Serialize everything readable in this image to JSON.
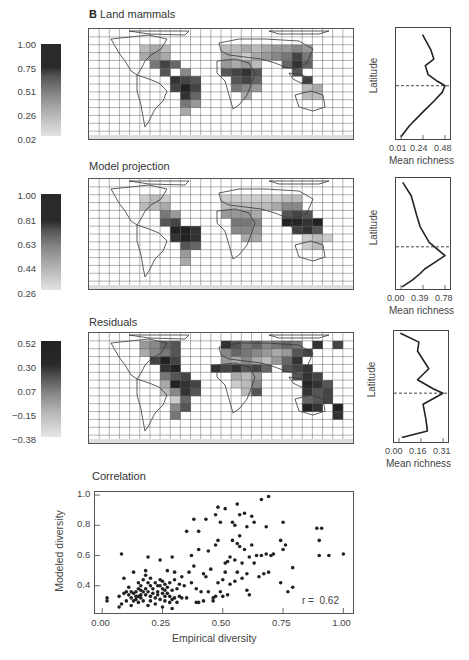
{
  "panel_label": "B",
  "panels": [
    {
      "title": "Land mammals",
      "colorbar": {
        "ticks": [
          "1.00",
          "0.75",
          "0.51",
          "0.26",
          "0.02"
        ]
      },
      "profile": {
        "xticks": [
          "0.01",
          "0.24",
          "0.48"
        ],
        "xlabel": "Mean richness",
        "ylabel": "Latitude"
      }
    },
    {
      "title": "Model projection",
      "colorbar": {
        "ticks": [
          "1.00",
          "0.81",
          "0.63",
          "0.44",
          "0.26"
        ]
      },
      "profile": {
        "xticks": [
          "0.00",
          "0.39",
          "0.78"
        ],
        "xlabel": "Mean richness",
        "ylabel": "Latitude"
      }
    },
    {
      "title": "Residuals",
      "colorbar": {
        "ticks": [
          "0.52",
          "0.30",
          "0.07",
          "−0.15",
          "−0.38"
        ]
      },
      "profile": {
        "xticks": [
          "0.00",
          "0.16",
          "0.31"
        ],
        "xlabel": "Mean richness",
        "ylabel": "Latitude"
      }
    }
  ],
  "correlation": {
    "title": "Correlation",
    "annotation": "r =  0.62"
  },
  "chart_data": [
    {
      "type": "heatmap",
      "title": "B Land mammals",
      "description": "Gridded world map of empirical land mammal diversity (greyscale, darker = higher)",
      "colorbar": {
        "min": 0.02,
        "max": 1.0,
        "ticks": [
          1.0,
          0.75,
          0.51,
          0.26,
          0.02
        ]
      }
    },
    {
      "type": "line",
      "title": "Land mammals latitudinal profile",
      "xlabel": "Mean richness",
      "ylabel": "Latitude",
      "xticks": [
        0.01,
        0.24,
        0.48
      ],
      "x": [
        0.24,
        0.33,
        0.36,
        0.27,
        0.3,
        0.4,
        0.48,
        0.45,
        0.36,
        0.24,
        0.1,
        0.01
      ],
      "y_frac": [
        0.06,
        0.2,
        0.28,
        0.34,
        0.42,
        0.48,
        0.52,
        0.58,
        0.66,
        0.76,
        0.88,
        0.98
      ],
      "equator_line": 0.52
    },
    {
      "type": "heatmap",
      "title": "Model projection",
      "description": "Gridded world map of modelled land mammal diversity",
      "colorbar": {
        "min": 0.26,
        "max": 1.0,
        "ticks": [
          1.0,
          0.81,
          0.63,
          0.44,
          0.26
        ]
      }
    },
    {
      "type": "line",
      "title": "Model projection latitudinal profile",
      "xlabel": "Mean richness",
      "ylabel": "Latitude",
      "xticks": [
        0.0,
        0.39,
        0.78
      ],
      "x": [
        0.03,
        0.18,
        0.28,
        0.34,
        0.5,
        0.78,
        0.6,
        0.42,
        0.34,
        0.2,
        0.02
      ],
      "y_frac": [
        0.04,
        0.16,
        0.34,
        0.44,
        0.58,
        0.7,
        0.76,
        0.82,
        0.86,
        0.92,
        0.98
      ],
      "equator_line": 0.62
    },
    {
      "type": "heatmap",
      "title": "Residuals",
      "description": "Gridded world map of residuals (empirical minus modelled)",
      "colorbar": {
        "min": -0.38,
        "max": 0.52,
        "ticks": [
          0.52,
          0.3,
          0.07,
          -0.15,
          -0.38
        ]
      }
    },
    {
      "type": "line",
      "title": "Residuals latitudinal profile",
      "xlabel": "Mean richness",
      "ylabel": "Latitude",
      "xticks": [
        0.0,
        0.16,
        0.31
      ],
      "x": [
        0.01,
        0.14,
        0.13,
        0.21,
        0.13,
        0.24,
        0.31,
        0.17,
        0.19,
        0.2,
        0.02
      ],
      "y_frac": [
        0.02,
        0.1,
        0.18,
        0.34,
        0.44,
        0.52,
        0.56,
        0.66,
        0.8,
        0.9,
        0.96
      ],
      "equator_line": 0.56
    },
    {
      "type": "scatter",
      "title": "Correlation",
      "xlabel": "Empirical diversity",
      "ylabel": "Modeled diversity",
      "xlim": [
        -0.03,
        1.04
      ],
      "ylim": [
        0.22,
        1.02
      ],
      "xticks": [
        0.0,
        0.25,
        0.5,
        0.75,
        1.0
      ],
      "yticks": [
        0.4,
        0.6,
        0.8,
        1.0
      ],
      "annotation": "r = 0.62",
      "points": [
        [
          0.02,
          0.32
        ],
        [
          0.02,
          0.3
        ],
        [
          0.07,
          0.33
        ],
        [
          0.07,
          0.26
        ],
        [
          0.08,
          0.28
        ],
        [
          0.08,
          0.61
        ],
        [
          0.09,
          0.45
        ],
        [
          0.09,
          0.35
        ],
        [
          0.1,
          0.36
        ],
        [
          0.1,
          0.3
        ],
        [
          0.11,
          0.39
        ],
        [
          0.11,
          0.34
        ],
        [
          0.12,
          0.36
        ],
        [
          0.12,
          0.32
        ],
        [
          0.12,
          0.27
        ],
        [
          0.13,
          0.35
        ],
        [
          0.13,
          0.3
        ],
        [
          0.13,
          0.49
        ],
        [
          0.14,
          0.36
        ],
        [
          0.14,
          0.33
        ],
        [
          0.14,
          0.31
        ],
        [
          0.15,
          0.38
        ],
        [
          0.15,
          0.42
        ],
        [
          0.15,
          0.33
        ],
        [
          0.15,
          0.29
        ],
        [
          0.16,
          0.34
        ],
        [
          0.16,
          0.37
        ],
        [
          0.16,
          0.4
        ],
        [
          0.16,
          0.32
        ],
        [
          0.17,
          0.44
        ],
        [
          0.17,
          0.36
        ],
        [
          0.17,
          0.3
        ],
        [
          0.18,
          0.47
        ],
        [
          0.18,
          0.5
        ],
        [
          0.18,
          0.38
        ],
        [
          0.18,
          0.34
        ],
        [
          0.19,
          0.59
        ],
        [
          0.19,
          0.42
        ],
        [
          0.19,
          0.36
        ],
        [
          0.19,
          0.27
        ],
        [
          0.2,
          0.45
        ],
        [
          0.2,
          0.4
        ],
        [
          0.2,
          0.33
        ],
        [
          0.2,
          0.3
        ],
        [
          0.21,
          0.38
        ],
        [
          0.21,
          0.35
        ],
        [
          0.22,
          0.42
        ],
        [
          0.22,
          0.32
        ],
        [
          0.22,
          0.28
        ],
        [
          0.23,
          0.4
        ],
        [
          0.23,
          0.36
        ],
        [
          0.23,
          0.34
        ],
        [
          0.24,
          0.44
        ],
        [
          0.24,
          0.4
        ],
        [
          0.24,
          0.31
        ],
        [
          0.24,
          0.57
        ],
        [
          0.25,
          0.43
        ],
        [
          0.25,
          0.38
        ],
        [
          0.25,
          0.35
        ],
        [
          0.25,
          0.26
        ],
        [
          0.26,
          0.41
        ],
        [
          0.26,
          0.37
        ],
        [
          0.26,
          0.33
        ],
        [
          0.26,
          0.3
        ],
        [
          0.27,
          0.5
        ],
        [
          0.27,
          0.39
        ],
        [
          0.27,
          0.35
        ],
        [
          0.28,
          0.42
        ],
        [
          0.28,
          0.33
        ],
        [
          0.28,
          0.29
        ],
        [
          0.29,
          0.59
        ],
        [
          0.29,
          0.37
        ],
        [
          0.29,
          0.31
        ],
        [
          0.29,
          0.25
        ],
        [
          0.3,
          0.44
        ],
        [
          0.3,
          0.32
        ],
        [
          0.3,
          0.49
        ],
        [
          0.31,
          0.38
        ],
        [
          0.31,
          0.29
        ],
        [
          0.32,
          0.41
        ],
        [
          0.32,
          0.33
        ],
        [
          0.33,
          0.32
        ],
        [
          0.33,
          0.46
        ],
        [
          0.34,
          0.4
        ],
        [
          0.35,
          0.76
        ],
        [
          0.35,
          0.32
        ],
        [
          0.36,
          0.49
        ],
        [
          0.37,
          0.6
        ],
        [
          0.37,
          0.42
        ],
        [
          0.38,
          0.84
        ],
        [
          0.38,
          0.53
        ],
        [
          0.39,
          0.38
        ],
        [
          0.39,
          0.29
        ],
        [
          0.4,
          0.64
        ],
        [
          0.4,
          0.76
        ],
        [
          0.4,
          0.29
        ],
        [
          0.41,
          0.36
        ],
        [
          0.42,
          0.48
        ],
        [
          0.42,
          0.3
        ],
        [
          0.43,
          0.84
        ],
        [
          0.43,
          0.46
        ],
        [
          0.44,
          0.63
        ],
        [
          0.44,
          0.36
        ],
        [
          0.45,
          0.51
        ],
        [
          0.46,
          0.32
        ],
        [
          0.46,
          0.3
        ],
        [
          0.47,
          0.87
        ],
        [
          0.47,
          0.67
        ],
        [
          0.47,
          0.33
        ],
        [
          0.48,
          0.92
        ],
        [
          0.48,
          0.7
        ],
        [
          0.48,
          0.42
        ],
        [
          0.49,
          0.82
        ],
        [
          0.49,
          0.36
        ],
        [
          0.5,
          0.44
        ],
        [
          0.5,
          0.33
        ],
        [
          0.51,
          0.91
        ],
        [
          0.51,
          0.55
        ],
        [
          0.51,
          0.49
        ],
        [
          0.52,
          0.56
        ],
        [
          0.52,
          0.34
        ],
        [
          0.53,
          0.59
        ],
        [
          0.53,
          0.41
        ],
        [
          0.54,
          0.82
        ],
        [
          0.54,
          0.7
        ],
        [
          0.55,
          0.8
        ],
        [
          0.55,
          0.57
        ],
        [
          0.55,
          0.43
        ],
        [
          0.56,
          0.94
        ],
        [
          0.56,
          0.68
        ],
        [
          0.56,
          0.49
        ],
        [
          0.57,
          0.87
        ],
        [
          0.57,
          0.73
        ],
        [
          0.57,
          0.66
        ],
        [
          0.58,
          0.55
        ],
        [
          0.58,
          0.45
        ],
        [
          0.59,
          0.88
        ],
        [
          0.59,
          0.64
        ],
        [
          0.6,
          0.79
        ],
        [
          0.6,
          0.48
        ],
        [
          0.6,
          0.37
        ],
        [
          0.61,
          0.59
        ],
        [
          0.61,
          0.34
        ],
        [
          0.62,
          0.86
        ],
        [
          0.62,
          0.67
        ],
        [
          0.63,
          0.82
        ],
        [
          0.63,
          0.55
        ],
        [
          0.64,
          0.6
        ],
        [
          0.65,
          0.46
        ],
        [
          0.66,
          0.97
        ],
        [
          0.66,
          0.6
        ],
        [
          0.67,
          0.48
        ],
        [
          0.68,
          0.79
        ],
        [
          0.68,
          0.61
        ],
        [
          0.69,
          0.99
        ],
        [
          0.69,
          0.49
        ],
        [
          0.7,
          0.6
        ],
        [
          0.71,
          0.61
        ],
        [
          0.74,
          0.7
        ],
        [
          0.74,
          0.42
        ],
        [
          0.75,
          0.82
        ],
        [
          0.75,
          0.64
        ],
        [
          0.76,
          0.67
        ],
        [
          0.77,
          0.36
        ],
        [
          0.79,
          0.52
        ],
        [
          0.79,
          0.39
        ],
        [
          0.89,
          0.78
        ],
        [
          0.9,
          0.7
        ],
        [
          0.9,
          0.6
        ],
        [
          0.91,
          0.78
        ],
        [
          0.94,
          0.6
        ],
        [
          1.0,
          0.61
        ]
      ]
    }
  ]
}
